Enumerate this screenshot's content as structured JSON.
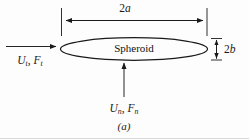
{
  "figure": {
    "caption": "(a)",
    "body_label": "Spheroid",
    "dimensions": [
      {
        "id": "major-axis",
        "label_prefix": "2",
        "label_symbol": "a",
        "orientation": "horizontal",
        "description": "major axis total length"
      },
      {
        "id": "minor-axis",
        "label_prefix": "2",
        "label_symbol": "b",
        "orientation": "vertical",
        "description": "minor axis total length"
      }
    ],
    "vectors": [
      {
        "id": "tangential",
        "velocity_symbol": "U",
        "velocity_subscript": "t",
        "separator": ", ",
        "force_symbol": "F",
        "force_subscript": "t",
        "direction": "right",
        "description": "tangential velocity and force"
      },
      {
        "id": "normal",
        "velocity_symbol": "U",
        "velocity_subscript": "n",
        "separator": ", ",
        "force_symbol": "F",
        "force_subscript": "n",
        "direction": "up",
        "description": "normal velocity and force"
      }
    ],
    "colors": {
      "stroke": "#1a1a1a",
      "text": "#111111",
      "background": "#fdfdfd",
      "footer_rule": "#d8d8d8"
    }
  }
}
